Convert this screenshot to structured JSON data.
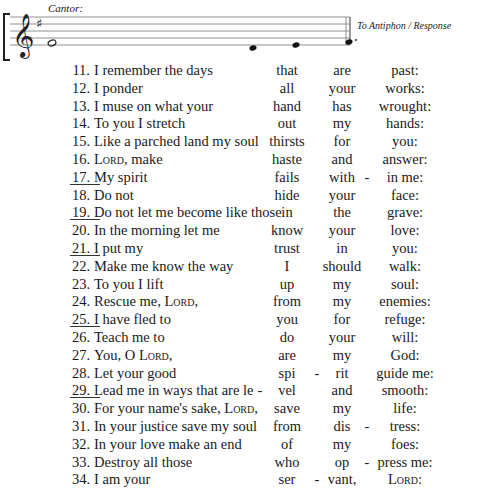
{
  "staff": {
    "cantor_label": "Cantor:",
    "antiphon_label": "To Antiphon / Response",
    "clef": "treble",
    "key_signature": "1 sharp"
  },
  "verses": [
    {
      "num": "11.",
      "text": "I remember the days",
      "c1": "that",
      "h1": "",
      "c2": "are",
      "h2": "",
      "c3": "past:",
      "h3": "",
      "ul": false
    },
    {
      "num": "12.",
      "text": "I ponder",
      "c1": "all",
      "h1": "",
      "c2": "your",
      "h2": "",
      "c3": "works:",
      "h3": "",
      "ul": false
    },
    {
      "num": "13.",
      "text": "I muse on what your",
      "c1": "hand",
      "h1": "",
      "c2": "has",
      "h2": "",
      "c3": "wrought:",
      "h3": "",
      "ul": false
    },
    {
      "num": "14.",
      "text": "To you I stretch",
      "c1": "out",
      "h1": "",
      "c2": "my",
      "h2": "",
      "c3": "hands:",
      "h3": "",
      "ul": false
    },
    {
      "num": "15.",
      "text": "Like a parched land my soul",
      "c1": "thirsts",
      "h1": "",
      "c2": "for",
      "h2": "",
      "c3": "you:",
      "h3": "",
      "ul": false
    },
    {
      "num": "16.",
      "text": "Lord, make",
      "c1": "haste",
      "h1": "",
      "c2": "and",
      "h2": "",
      "c3": "answer:",
      "h3": "",
      "ul": false
    },
    {
      "num": "17.",
      "text": "My spirit",
      "c1": "fails",
      "h1": "",
      "c2": "with",
      "h2": "",
      "c3": "in me:",
      "h3": "-",
      "ul": true
    },
    {
      "num": "18.",
      "text": "Do not",
      "c1": "hide",
      "h1": "",
      "c2": "your",
      "h2": "",
      "c3": "face:",
      "h3": "",
      "ul": false
    },
    {
      "num": "19.",
      "text": "Do not let me become like those",
      "c1": "in",
      "h1": "",
      "c2": "the",
      "h2": "",
      "c3": "grave:",
      "h3": "",
      "ul": true
    },
    {
      "num": "20.",
      "text": "In the morning let me",
      "c1": "know",
      "h1": "",
      "c2": "your",
      "h2": "",
      "c3": "love:",
      "h3": "",
      "ul": false
    },
    {
      "num": "21.",
      "text": "I put my",
      "c1": "trust",
      "h1": "",
      "c2": "in",
      "h2": "",
      "c3": "you:",
      "h3": "",
      "ul": true
    },
    {
      "num": "22.",
      "text": "Make me know the way",
      "c1": "I",
      "h1": "",
      "c2": "should",
      "h2": "",
      "c3": "walk:",
      "h3": "",
      "ul": false
    },
    {
      "num": "23.",
      "text": "To you I lift",
      "c1": "up",
      "h1": "",
      "c2": "my",
      "h2": "",
      "c3": "soul:",
      "h3": "",
      "ul": false
    },
    {
      "num": "24.",
      "text": "Rescue me, Lord,",
      "c1": "from",
      "h1": "",
      "c2": "my",
      "h2": "",
      "c3": "enemies:",
      "h3": "",
      "ul": false
    },
    {
      "num": "25.",
      "text": "I have fled to",
      "c1": "you",
      "h1": "",
      "c2": "for",
      "h2": "",
      "c3": "refuge:",
      "h3": "",
      "ul": true
    },
    {
      "num": "26.",
      "text": "Teach me to",
      "c1": "do",
      "h1": "",
      "c2": "your",
      "h2": "",
      "c3": "will:",
      "h3": "",
      "ul": false
    },
    {
      "num": "27.",
      "text": "You, O Lord,",
      "c1": "are",
      "h1": "",
      "c2": "my",
      "h2": "",
      "c3": "God:",
      "h3": "",
      "ul": false
    },
    {
      "num": "28.",
      "text": "Let your good",
      "c1": "spi",
      "h1": "",
      "c2": "rit",
      "h2": "-",
      "c3": "guide me:",
      "h3": "",
      "ul": false
    },
    {
      "num": "29.",
      "text": "Lead me in ways that are le",
      "c1": "vel",
      "h1": "-",
      "c2": "and",
      "h2": "",
      "c3": "smooth:",
      "h3": "",
      "ul": true
    },
    {
      "num": "30.",
      "text": "For your name's sake, Lord,",
      "c1": "save",
      "h1": "",
      "c2": "my",
      "h2": "",
      "c3": "life:",
      "h3": "",
      "ul": false
    },
    {
      "num": "31.",
      "text": "In your justice save my soul",
      "c1": "from",
      "h1": "",
      "c2": "dis",
      "h2": "",
      "c3": "tress:",
      "h3": "-",
      "ul": false
    },
    {
      "num": "32.",
      "text": "In your love make an end",
      "c1": "of",
      "h1": "",
      "c2": "my",
      "h2": "",
      "c3": "foes:",
      "h3": "",
      "ul": false
    },
    {
      "num": "33.",
      "text": "Destroy all those",
      "c1": "who",
      "h1": "",
      "c2": "op",
      "h2": "",
      "c3": "press me:",
      "h3": "-",
      "ul": false
    },
    {
      "num": "34.",
      "text": "I am your",
      "c1": "ser",
      "h1": "",
      "c2": "vant,",
      "h2": "-",
      "c3": "Lord:",
      "h3": "",
      "ul": false
    }
  ]
}
